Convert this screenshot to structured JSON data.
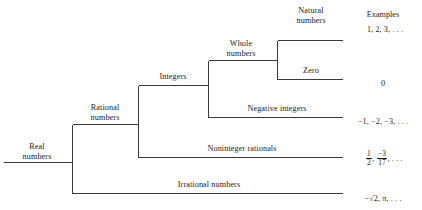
{
  "diagram": {
    "line_color": "#3a3a3a",
    "text_color": "#1b1b1b",
    "background": "#ffffff",
    "examples_header": "Examples",
    "nodes": {
      "real": {
        "line1": "Real",
        "line2": "numbers"
      },
      "rational": {
        "line1": "Rational",
        "line2": "numbers"
      },
      "integers": {
        "line1": "Integers",
        "line2": ""
      },
      "whole": {
        "line1": "Whole",
        "line2": "numbers"
      },
      "natural": {
        "line1": "Natural",
        "line2": "numbers"
      },
      "zero": {
        "line1": "Zero",
        "line2": ""
      },
      "negative_integers": {
        "line1": "Negative integers",
        "line2": ""
      },
      "noninteger_rationals": {
        "line1": "Noninteger rationals",
        "line2": ""
      },
      "irrational": {
        "line1": "Irrational numbers",
        "line2": ""
      }
    },
    "examples": {
      "natural": "1, 2, 3, . . .",
      "zero": "0",
      "negative_integers": "−1, −2, −3, . . .",
      "noninteger_rationals": {
        "frac1_num": "1",
        "frac1_den": "2",
        "sep1": ",",
        "frac2_num": "−3",
        "frac2_den": "17",
        "tail": ", . . ."
      },
      "irrational": "−√2, π, . . ."
    }
  }
}
